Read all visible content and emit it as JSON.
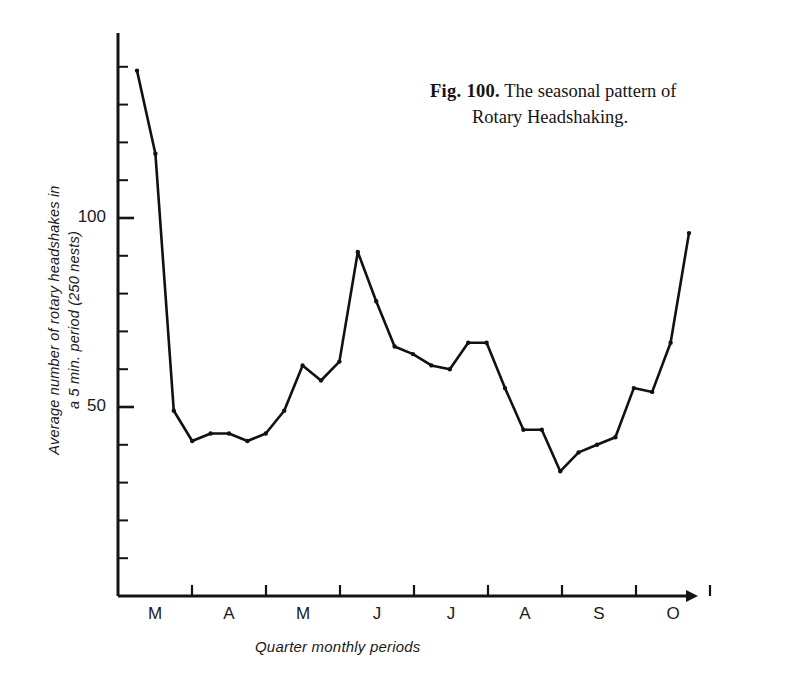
{
  "figure": {
    "caption_label": "Fig. 100.",
    "caption_text": "The seasonal pattern of",
    "caption_text_line2": "Rotary Headshaking."
  },
  "chart_data": {
    "type": "line",
    "title": "The seasonal pattern of Rotary Headshaking.",
    "xlabel": "Quarter monthly periods",
    "ylabel": "Average number of rotary headshakes in a 5 min. period (250 nests)",
    "ylabel_line1": "Average number of rotary headshakes in",
    "ylabel_line2": "a 5 min. period (250 nests)",
    "ylim": [
      0,
      145
    ],
    "yticks": [
      10,
      20,
      30,
      40,
      50,
      60,
      70,
      80,
      90,
      100,
      110,
      120,
      130,
      140
    ],
    "ytick_labels": [
      {
        "value": 100,
        "label": "100"
      },
      {
        "value": 50,
        "label": "50"
      }
    ],
    "grid": false,
    "legend": "none",
    "x_month_labels": [
      "M",
      "A",
      "M",
      "J",
      "J",
      "A",
      "S",
      "O"
    ],
    "x_note": "x values are quarter-monthly periods; 4 periods per month",
    "x": [
      1,
      2,
      3,
      4,
      5,
      6,
      7,
      8,
      9,
      10,
      11,
      12,
      13,
      14,
      15,
      16,
      17,
      18,
      19,
      20,
      21,
      22,
      23,
      24,
      25,
      26,
      27,
      28,
      29,
      30,
      31
    ],
    "values": [
      139,
      117,
      49,
      41,
      43,
      43,
      41,
      43,
      49,
      61,
      57,
      62,
      91,
      78,
      66,
      64,
      61,
      60,
      67,
      67,
      55,
      44,
      44,
      33,
      38,
      40,
      42,
      55,
      54,
      67,
      96
    ],
    "series": [
      {
        "name": "Rotary headshakes",
        "marker": "dot",
        "color": "#111111",
        "values": [
          139,
          117,
          49,
          41,
          43,
          43,
          41,
          43,
          49,
          61,
          57,
          62,
          91,
          78,
          66,
          64,
          61,
          60,
          67,
          67,
          55,
          44,
          44,
          33,
          38,
          40,
          42,
          55,
          54,
          67,
          96
        ]
      }
    ]
  },
  "axes": {
    "y_axis_name": "vertical-axis",
    "x_axis_name": "horizontal-axis",
    "x_tick_count": 8,
    "y_tick_count": 14
  }
}
